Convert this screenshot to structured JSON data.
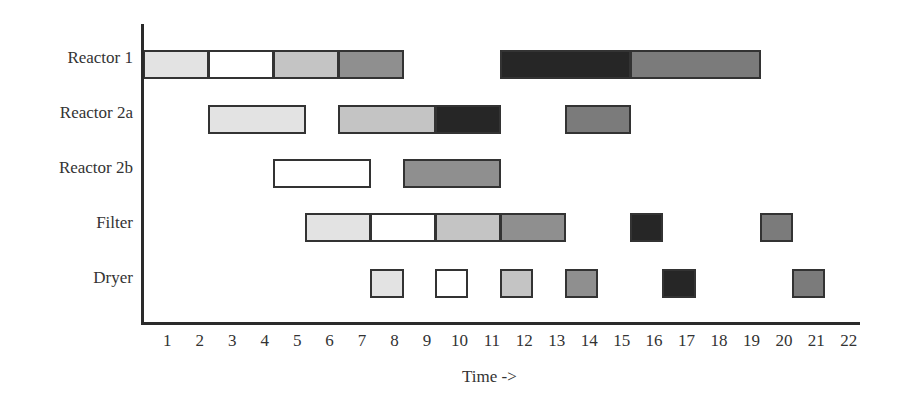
{
  "chart_data": {
    "type": "gantt",
    "title": "",
    "xlabel": "Time ->",
    "ylabel": "",
    "x_ticks": [
      1,
      2,
      3,
      4,
      5,
      6,
      7,
      8,
      9,
      10,
      11,
      12,
      13,
      14,
      15,
      16,
      17,
      18,
      19,
      20,
      21,
      22
    ],
    "xlim": [
      0,
      22
    ],
    "grid": false,
    "legend": null,
    "categories": [
      "Reactor 1",
      "Reactor 2a",
      "Reactor 2b",
      "Filter",
      "Dryer"
    ],
    "shade_colors": {
      "light": "#e3e3e3",
      "white": "#ffffff",
      "medium_light": "#c4c4c4",
      "medium": "#8f8f8f",
      "medium_dark": "#7b7b7b",
      "dark": "#262626"
    },
    "tasks": [
      {
        "resource": "Reactor 1",
        "start": 0,
        "end": 2,
        "shade": "light"
      },
      {
        "resource": "Reactor 1",
        "start": 2,
        "end": 4,
        "shade": "white"
      },
      {
        "resource": "Reactor 1",
        "start": 4,
        "end": 6,
        "shade": "medium_light"
      },
      {
        "resource": "Reactor 1",
        "start": 6,
        "end": 8,
        "shade": "medium"
      },
      {
        "resource": "Reactor 1",
        "start": 11,
        "end": 15,
        "shade": "dark"
      },
      {
        "resource": "Reactor 1",
        "start": 15,
        "end": 19,
        "shade": "medium_dark"
      },
      {
        "resource": "Reactor 2a",
        "start": 2,
        "end": 5,
        "shade": "light"
      },
      {
        "resource": "Reactor 2a",
        "start": 6,
        "end": 9,
        "shade": "medium_light"
      },
      {
        "resource": "Reactor 2a",
        "start": 9,
        "end": 11,
        "shade": "dark"
      },
      {
        "resource": "Reactor 2a",
        "start": 13,
        "end": 15,
        "shade": "medium_dark"
      },
      {
        "resource": "Reactor 2b",
        "start": 4,
        "end": 7,
        "shade": "white"
      },
      {
        "resource": "Reactor 2b",
        "start": 8,
        "end": 11,
        "shade": "medium"
      },
      {
        "resource": "Filter",
        "start": 5,
        "end": 7,
        "shade": "light"
      },
      {
        "resource": "Filter",
        "start": 7,
        "end": 9,
        "shade": "white"
      },
      {
        "resource": "Filter",
        "start": 9,
        "end": 11,
        "shade": "medium_light"
      },
      {
        "resource": "Filter",
        "start": 11,
        "end": 13,
        "shade": "medium"
      },
      {
        "resource": "Filter",
        "start": 15,
        "end": 16,
        "shade": "dark"
      },
      {
        "resource": "Filter",
        "start": 19,
        "end": 20,
        "shade": "medium_dark"
      },
      {
        "resource": "Dryer",
        "start": 7,
        "end": 8,
        "shade": "light"
      },
      {
        "resource": "Dryer",
        "start": 9,
        "end": 10,
        "shade": "white"
      },
      {
        "resource": "Dryer",
        "start": 11,
        "end": 12,
        "shade": "medium_light"
      },
      {
        "resource": "Dryer",
        "start": 13,
        "end": 14,
        "shade": "medium"
      },
      {
        "resource": "Dryer",
        "start": 16,
        "end": 17,
        "shade": "dark"
      },
      {
        "resource": "Dryer",
        "start": 20,
        "end": 21,
        "shade": "medium_dark"
      }
    ]
  }
}
